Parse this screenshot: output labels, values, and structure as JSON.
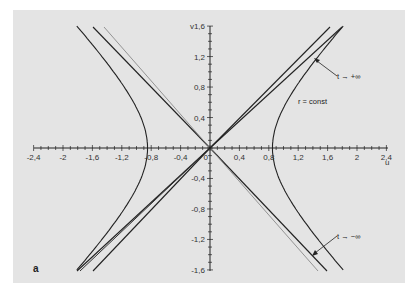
{
  "figure": {
    "panel_label": "a",
    "background": "#e4e4e4",
    "axes": {
      "x_label": "u",
      "y_label": "v",
      "x_ticks": [
        "-2,4",
        "-2",
        "-1,6",
        "-1,2",
        "-0,8",
        "-0,4",
        "0",
        "0,4",
        "0,8",
        "1,2",
        "1,6",
        "2",
        "2,4"
      ],
      "x_tick_values": [
        -2.4,
        -2,
        -1.6,
        -1.2,
        -0.8,
        -0.4,
        0,
        0.4,
        0.8,
        1.2,
        1.6,
        2,
        2.4
      ],
      "y_ticks": [
        "1,6",
        "1,2",
        "0,8",
        "0,4",
        "-0,4",
        "-0,8",
        "-1,2",
        "-1,6"
      ],
      "y_tick_values": [
        1.6,
        1.2,
        0.8,
        0.4,
        -0.4,
        -0.8,
        -1.2,
        -1.6
      ]
    },
    "annotations": {
      "t_plus": "t → +∞",
      "t_minus": "t → −∞",
      "r_const": "r = const"
    },
    "colors": {
      "curve": "#222222",
      "light_line": "#8a8a8a",
      "axis": "#222222"
    }
  }
}
